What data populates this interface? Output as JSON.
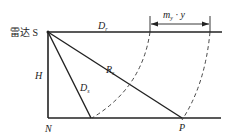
{
  "diagram": {
    "type": "radar-geometry",
    "labels": {
      "radar": "雷达 S",
      "Dr": {
        "main": "D",
        "sub": "r"
      },
      "Rs": {
        "main": "R",
        "sub": "s"
      },
      "Ds": {
        "main": "D",
        "sub": "s"
      },
      "H": "H",
      "N": "N",
      "P": "P",
      "dimension": {
        "main": "m",
        "sub": "y",
        "rest": " · y"
      }
    },
    "colors": {
      "line": "#222222",
      "background": "#ffffff"
    }
  }
}
